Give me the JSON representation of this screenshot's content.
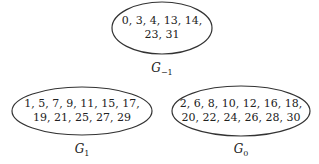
{
  "nodes": [
    {
      "id": "G_-1",
      "label": "G",
      "subscript": "−1",
      "line1": "0, 3, 4, 13, 14,",
      "line2": "23, 31"
    },
    {
      "id": "G_1",
      "label": "G",
      "subscript": "1",
      "line1": "1, 5, 7, 9, 11, 15, 17,",
      "line2": "19, 21, 25, 27, 29"
    },
    {
      "id": "G_0",
      "label": "G",
      "subscript": "0",
      "line1": "2, 6, 8, 10, 12, 16, 18,",
      "line2": "20, 22, 24, 26, 28, 30"
    }
  ],
  "colors": {
    "stroke": "#333333",
    "text": "#222222"
  }
}
